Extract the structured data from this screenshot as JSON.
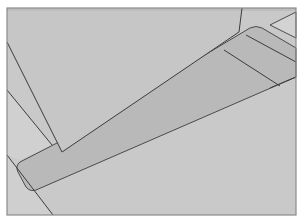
{
  "figure": {
    "colors": {
      "page_background": "#ffffff",
      "panel_fill": "#c9c9c9",
      "wedge_fill": "#c2c2c2",
      "plate_fill": "#b8b8b8",
      "light_face_fill": "#d0d0d0",
      "line": "#3c3c3c",
      "frame_line": "#8a8a8a"
    },
    "frame": {
      "x": 7,
      "y": 8,
      "width": 289,
      "height": 207
    }
  }
}
